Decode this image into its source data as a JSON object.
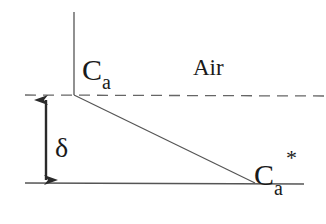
{
  "diagram": {
    "labels": {
      "surface_concentration": {
        "main": "C",
        "sub": "a"
      },
      "air": "Air",
      "film_thickness": "δ",
      "equilibrium_concentration": {
        "main": "C",
        "sub": "a",
        "sup": "*"
      }
    },
    "colors": {
      "line": "#4a4a4a",
      "text": "#1a1a1a",
      "background": "#ffffff"
    }
  }
}
